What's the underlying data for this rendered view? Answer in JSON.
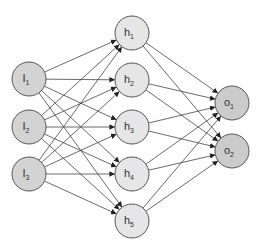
{
  "diagram": {
    "type": "neural-network",
    "colors": {
      "input_fill": "#d3d3d3",
      "hidden_fill": "#e6e6e6",
      "output_fill": "#cbcbcb",
      "stroke": "#555555",
      "edge": "#444444"
    },
    "radius": 17,
    "layers": [
      {
        "name": "input",
        "nodes": [
          {
            "id": "I1",
            "base": "I",
            "sub": "1",
            "x": 29,
            "y": 79
          },
          {
            "id": "I2",
            "base": "I",
            "sub": "2",
            "x": 29,
            "y": 127
          },
          {
            "id": "I3",
            "base": "I",
            "sub": "3",
            "x": 29,
            "y": 174
          }
        ]
      },
      {
        "name": "hidden",
        "nodes": [
          {
            "id": "h1",
            "base": "h",
            "sub": "1",
            "x": 132,
            "y": 33
          },
          {
            "id": "h2",
            "base": "h",
            "sub": "2",
            "x": 132,
            "y": 80
          },
          {
            "id": "h3",
            "base": "h",
            "sub": "3",
            "x": 132,
            "y": 127
          },
          {
            "id": "h4",
            "base": "h",
            "sub": "4",
            "x": 132,
            "y": 174
          },
          {
            "id": "h5",
            "base": "h",
            "sub": "5",
            "x": 132,
            "y": 221
          }
        ]
      },
      {
        "name": "output",
        "nodes": [
          {
            "id": "o1",
            "base": "o",
            "sub": "1",
            "x": 232,
            "y": 103
          },
          {
            "id": "o2",
            "base": "o",
            "sub": "2",
            "x": 232,
            "y": 151
          }
        ]
      }
    ],
    "connectivity": "fully-connected between consecutive layers, arrows pointing forward"
  }
}
